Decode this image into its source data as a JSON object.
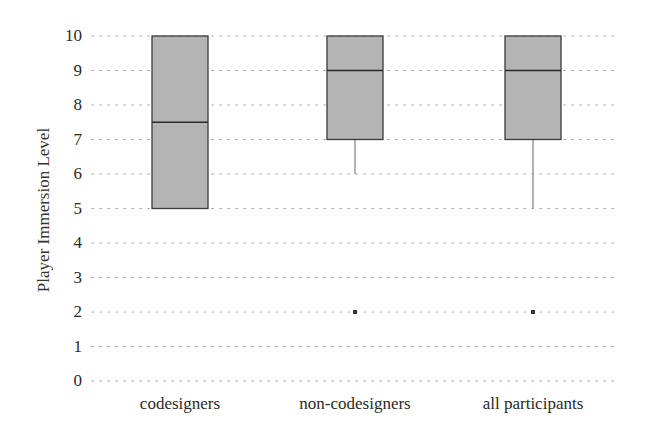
{
  "chart_data": {
    "type": "box",
    "title": "",
    "xlabel": "",
    "ylabel": "Player Immersion Level",
    "ylim": [
      0,
      10
    ],
    "yticks": [
      "0",
      "1",
      "2",
      "3",
      "4",
      "5",
      "6",
      "7",
      "8",
      "9",
      "10"
    ],
    "grid": "dotted horizontal",
    "categories": [
      "codesigners",
      "non-codesigners",
      "all participants"
    ],
    "series": [
      {
        "name": "codesigners",
        "min": 5,
        "q1": 5,
        "median": 7.5,
        "q3": 10,
        "max": 10,
        "outliers": []
      },
      {
        "name": "non-codesigners",
        "min": 6,
        "q1": 7,
        "median": 9,
        "q3": 10,
        "max": 10,
        "outliers": [
          2
        ]
      },
      {
        "name": "all participants",
        "min": 5,
        "q1": 7,
        "median": 9,
        "q3": 10,
        "max": 10,
        "outliers": [
          2
        ]
      }
    ],
    "colors": {
      "box_fill": "#b4b4b4",
      "box_edge": "#3a3a3a",
      "grid": "#9a9a9a"
    }
  }
}
